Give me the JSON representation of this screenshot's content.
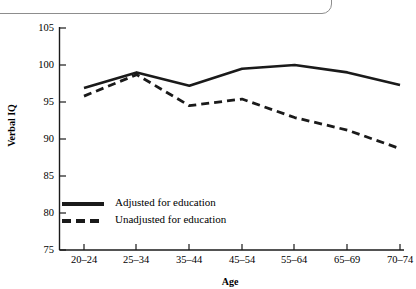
{
  "chart_data": {
    "type": "line",
    "title": "",
    "subtitle": "",
    "xlabel": "Age",
    "ylabel": "Verbal IQ",
    "categories": [
      "20–24",
      "25–34",
      "35–44",
      "45–54",
      "55–64",
      "65–69",
      "70–74"
    ],
    "ylim": [
      75,
      105
    ],
    "yticks": [
      75,
      80,
      85,
      90,
      95,
      100,
      105
    ],
    "ytick_labels": [
      "75",
      "80",
      "85",
      "90",
      "95",
      "100",
      "105"
    ],
    "grid": false,
    "legend_position": "inside-lower-left",
    "series": [
      {
        "name": "Adjusted for education",
        "style": "solid",
        "color": "#1a1a1a",
        "values": [
          96.9,
          99.0,
          97.2,
          99.5,
          100.0,
          99.0,
          97.3
        ]
      },
      {
        "name": "Unadjusted for education",
        "style": "dashed",
        "color": "#1a1a1a",
        "values": [
          95.8,
          98.7,
          94.5,
          95.4,
          92.9,
          91.2,
          88.7
        ]
      }
    ]
  },
  "legend": {
    "entries": [
      {
        "label": "Adjusted for education"
      },
      {
        "label": "Unadjusted for education"
      }
    ]
  },
  "axes": {
    "y_title": "Verbal IQ",
    "x_title": "Age"
  }
}
